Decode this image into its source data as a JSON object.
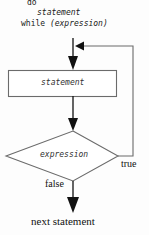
{
  "diagram": {
    "type": "flowchart",
    "code": {
      "line1": "do",
      "line2": "statement",
      "line3_keyword": "while",
      "line3_expression": " (expression)"
    },
    "nodes": {
      "process": {
        "shape": "rectangle",
        "label": "statement"
      },
      "decision": {
        "shape": "diamond",
        "label": "expression"
      },
      "terminal": {
        "shape": "text",
        "label": "next statement"
      }
    },
    "edges": {
      "true_label": "true",
      "false_label": "false"
    },
    "colors": {
      "stroke": "#5a5a5a",
      "arrow": "#111111",
      "text": "#1a1a1a",
      "background": "#fdfdfd"
    }
  }
}
